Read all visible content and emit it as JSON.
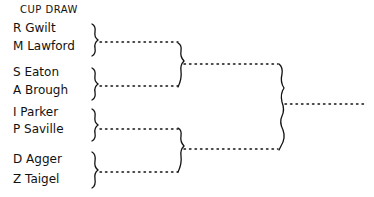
{
  "title": "CUP DRAW",
  "round1": [
    {
      "players": [
        "R Gwilt",
        "M Lawford"
      ]
    },
    {
      "players": [
        "S Eaton",
        "A Brough"
      ]
    },
    {
      "players": [
        "I Parker",
        "P Saville"
      ]
    },
    {
      "players": [
        "D Agger",
        "Z Taigel"
      ]
    }
  ],
  "players": [
    "R Gwilt",
    "M Lawford",
    "S Eaton",
    "A Brough",
    "I Parker",
    "P Saville",
    "D Agger",
    "Z Taigel"
  ],
  "line_color": "#111111"
}
